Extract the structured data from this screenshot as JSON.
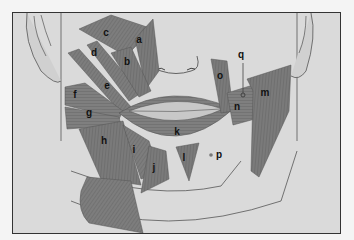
{
  "figure": {
    "labels": [
      {
        "id": "a",
        "text": "a",
        "x": 139,
        "y": 40
      },
      {
        "id": "b",
        "text": "b",
        "x": 127,
        "y": 62
      },
      {
        "id": "c",
        "text": "c",
        "x": 106,
        "y": 33
      },
      {
        "id": "d",
        "text": "d",
        "x": 94,
        "y": 53
      },
      {
        "id": "e",
        "text": "e",
        "x": 107,
        "y": 86
      },
      {
        "id": "f",
        "text": "f",
        "x": 75,
        "y": 95
      },
      {
        "id": "g",
        "text": "g",
        "x": 89,
        "y": 113
      },
      {
        "id": "h",
        "text": "h",
        "x": 104,
        "y": 141
      },
      {
        "id": "i",
        "text": "i",
        "x": 134,
        "y": 150
      },
      {
        "id": "j",
        "text": "j",
        "x": 154,
        "y": 168
      },
      {
        "id": "k",
        "text": "k",
        "x": 177,
        "y": 132
      },
      {
        "id": "l",
        "text": "l",
        "x": 184,
        "y": 158
      },
      {
        "id": "m",
        "text": "m",
        "x": 265,
        "y": 93
      },
      {
        "id": "n",
        "text": "n",
        "x": 237,
        "y": 107
      },
      {
        "id": "o",
        "text": "o",
        "x": 220,
        "y": 76
      },
      {
        "id": "p",
        "text": "p",
        "x": 219,
        "y": 155
      },
      {
        "id": "q",
        "text": "q",
        "x": 241,
        "y": 55
      }
    ],
    "colors": {
      "background": "#dadada",
      "muscle": "#7a7a7a",
      "muscle_dark": "#5e5e5e",
      "skin_outline": "#555555",
      "frame": "#333333"
    }
  }
}
